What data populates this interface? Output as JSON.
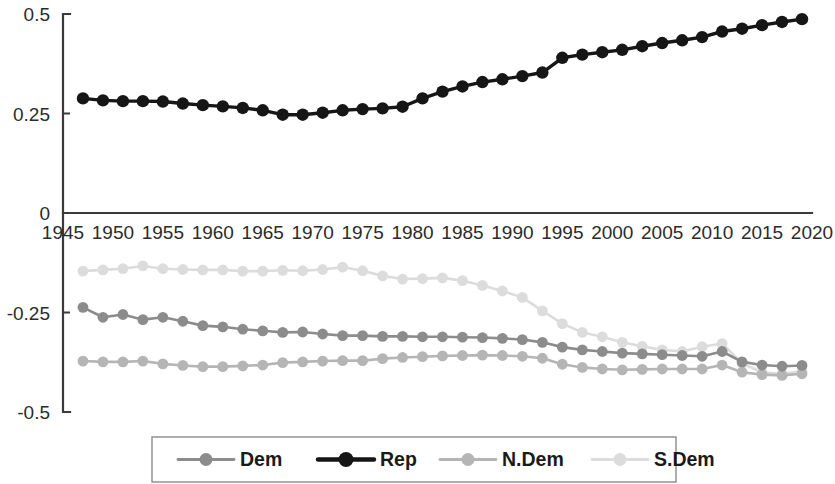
{
  "chart_data": {
    "type": "line",
    "title": "",
    "subtitle": "",
    "xlabel": "",
    "ylabel": "",
    "xlim": [
      1945,
      2020
    ],
    "ylim": [
      -0.5,
      0.5
    ],
    "yticks": [
      -0.5,
      -0.25,
      0,
      0.25,
      0.5
    ],
    "ytick_labels": [
      "-0.5",
      "-0.25",
      "0",
      "0.25",
      "0.5"
    ],
    "xticks": [
      1945,
      1950,
      1955,
      1960,
      1965,
      1970,
      1975,
      1980,
      1985,
      1990,
      1995,
      2000,
      2005,
      2010,
      2015,
      2020
    ],
    "xtick_labels": [
      "1945",
      "1950",
      "1955",
      "1960",
      "1965",
      "1970",
      "1975",
      "1980",
      "1985",
      "1990",
      "1995",
      "2000",
      "2005",
      "2010",
      "2015",
      "2020"
    ],
    "grid": false,
    "legend_position": "bottom",
    "markers": true,
    "x": [
      1947,
      1949,
      1951,
      1953,
      1955,
      1957,
      1959,
      1961,
      1963,
      1965,
      1967,
      1969,
      1971,
      1973,
      1975,
      1977,
      1979,
      1981,
      1983,
      1985,
      1987,
      1989,
      1991,
      1993,
      1995,
      1997,
      1999,
      2001,
      2003,
      2005,
      2007,
      2009,
      2011,
      2013,
      2015,
      2017,
      2019
    ],
    "series": [
      {
        "name": "Dem",
        "color": "#8c8c8c",
        "values": [
          -0.237,
          -0.262,
          -0.255,
          -0.268,
          -0.262,
          -0.272,
          -0.283,
          -0.286,
          -0.292,
          -0.296,
          -0.3,
          -0.299,
          -0.304,
          -0.308,
          -0.308,
          -0.31,
          -0.31,
          -0.311,
          -0.311,
          -0.312,
          -0.313,
          -0.315,
          -0.318,
          -0.325,
          -0.337,
          -0.344,
          -0.348,
          -0.352,
          -0.354,
          -0.356,
          -0.358,
          -0.36,
          -0.348,
          -0.374,
          -0.382,
          -0.385,
          -0.383
        ]
      },
      {
        "name": "Rep",
        "color": "#161616",
        "values": [
          0.288,
          0.283,
          0.281,
          0.281,
          0.28,
          0.275,
          0.271,
          0.268,
          0.264,
          0.258,
          0.247,
          0.247,
          0.252,
          0.258,
          0.261,
          0.263,
          0.267,
          0.288,
          0.305,
          0.318,
          0.329,
          0.336,
          0.344,
          0.353,
          0.39,
          0.398,
          0.404,
          0.41,
          0.419,
          0.427,
          0.434,
          0.442,
          0.456,
          0.463,
          0.472,
          0.48,
          0.487
        ]
      },
      {
        "name": "N.Dem",
        "color": "#b5b5b5",
        "values": [
          -0.372,
          -0.374,
          -0.374,
          -0.372,
          -0.379,
          -0.383,
          -0.386,
          -0.386,
          -0.384,
          -0.382,
          -0.376,
          -0.374,
          -0.372,
          -0.371,
          -0.371,
          -0.366,
          -0.363,
          -0.361,
          -0.359,
          -0.358,
          -0.357,
          -0.358,
          -0.36,
          -0.365,
          -0.38,
          -0.388,
          -0.392,
          -0.394,
          -0.393,
          -0.392,
          -0.392,
          -0.392,
          -0.382,
          -0.4,
          -0.406,
          -0.408,
          -0.404
        ]
      },
      {
        "name": "S.Dem",
        "color": "#dcdcdc",
        "values": [
          -0.146,
          -0.143,
          -0.14,
          -0.133,
          -0.14,
          -0.142,
          -0.143,
          -0.143,
          -0.146,
          -0.146,
          -0.144,
          -0.145,
          -0.142,
          -0.136,
          -0.145,
          -0.158,
          -0.166,
          -0.165,
          -0.163,
          -0.17,
          -0.182,
          -0.196,
          -0.212,
          -0.246,
          -0.278,
          -0.3,
          -0.311,
          -0.325,
          -0.335,
          -0.344,
          -0.348,
          -0.336,
          -0.328,
          -0.378,
          -0.4,
          -0.404,
          -0.398
        ]
      }
    ]
  },
  "legend": {
    "entries": [
      {
        "label": "Dem",
        "color": "#8c8c8c"
      },
      {
        "label": "Rep",
        "color": "#161616"
      },
      {
        "label": "N.Dem",
        "color": "#b5b5b5"
      },
      {
        "label": "S.Dem",
        "color": "#dcdcdc"
      }
    ]
  }
}
